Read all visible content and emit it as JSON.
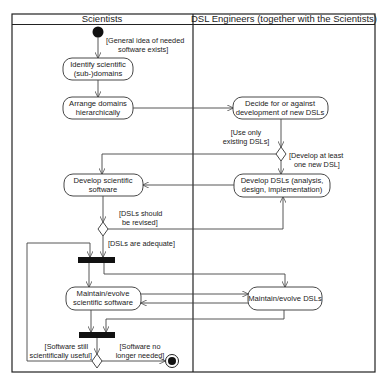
{
  "diagram": {
    "type": "UML activity diagram with swimlanes",
    "lanes": [
      {
        "id": "scientists",
        "label": "Scientists"
      },
      {
        "id": "dsl_engineers",
        "label": "DSL Engineers (together with the Scientists)"
      }
    ],
    "nodes": {
      "start": {
        "type": "initial"
      },
      "identify": {
        "type": "action",
        "lane": "scientists",
        "lines": [
          "Identify scientific",
          "(sub-)domains"
        ]
      },
      "arrange": {
        "type": "action",
        "lane": "scientists",
        "lines": [
          "Arrange domains",
          "hierarchically"
        ]
      },
      "decide": {
        "type": "action",
        "lane": "dsl_engineers",
        "lines": [
          "Decide for or against",
          "development of new DSLs"
        ]
      },
      "decision_dsl": {
        "type": "decision",
        "lane": "dsl_engineers"
      },
      "develop_dsls": {
        "type": "action",
        "lane": "dsl_engineers",
        "lines": [
          "Develop DSLs (analysis,",
          "design, implementation)"
        ]
      },
      "develop_sw": {
        "type": "action",
        "lane": "scientists",
        "lines": [
          "Develop scientific",
          "software"
        ]
      },
      "decision_revise": {
        "type": "decision",
        "lane": "scientists"
      },
      "fork": {
        "type": "fork",
        "lane": "scientists"
      },
      "maintain_sw": {
        "type": "action",
        "lane": "scientists",
        "lines": [
          "Maintain/evolve",
          "scientific software"
        ]
      },
      "maintain_dsls": {
        "type": "action",
        "lane": "dsl_engineers",
        "lines": [
          "Maintain/evolve DSLs"
        ]
      },
      "join": {
        "type": "join",
        "lane": "scientists"
      },
      "decision_end": {
        "type": "decision",
        "lane": "scientists"
      },
      "end": {
        "type": "final"
      }
    },
    "guards": {
      "start_to_identify": [
        "[General idea of needed",
        "software exists]"
      ],
      "use_existing": [
        "[Use only",
        "existing DSLs]"
      ],
      "develop_new": [
        "[Develop at least",
        "one new DSL]"
      ],
      "revise": [
        "[DSLs should",
        "be revised]"
      ],
      "adequate": [
        "[DSLs are adequate]"
      ],
      "still_useful": [
        "[Software still",
        "scientifically useful]"
      ],
      "no_longer_needed": [
        "[Software no",
        "longer needed]"
      ]
    },
    "edges": [
      {
        "from": "start",
        "to": "identify",
        "guard": "start_to_identify"
      },
      {
        "from": "identify",
        "to": "arrange"
      },
      {
        "from": "arrange",
        "to": "decide"
      },
      {
        "from": "decide",
        "to": "decision_dsl"
      },
      {
        "from": "decision_dsl",
        "to": "develop_sw",
        "guard": "use_existing"
      },
      {
        "from": "decision_dsl",
        "to": "develop_dsls",
        "guard": "develop_new"
      },
      {
        "from": "develop_dsls",
        "to": "develop_sw"
      },
      {
        "from": "develop_sw",
        "to": "decision_revise"
      },
      {
        "from": "decision_revise",
        "to": "develop_dsls",
        "guard": "revise"
      },
      {
        "from": "decision_revise",
        "to": "fork",
        "guard": "adequate"
      },
      {
        "from": "fork",
        "to": "maintain_sw"
      },
      {
        "from": "fork",
        "to": "maintain_dsls"
      },
      {
        "from": "maintain_sw",
        "to": "maintain_dsls"
      },
      {
        "from": "maintain_dsls",
        "to": "maintain_sw"
      },
      {
        "from": "maintain_dsls",
        "to": "join"
      },
      {
        "from": "maintain_sw",
        "to": "join"
      },
      {
        "from": "join",
        "to": "decision_end"
      },
      {
        "from": "decision_end",
        "to": "fork",
        "guard": "still_useful"
      },
      {
        "from": "decision_end",
        "to": "end",
        "guard": "no_longer_needed"
      }
    ]
  }
}
